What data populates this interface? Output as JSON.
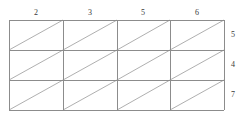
{
  "figure": {
    "type": "grid-diagram",
    "line_color": "#8c8c8c",
    "diagonal_color": "#a6a6a6",
    "label_color": "#3a3a3a",
    "background": "#ffffff",
    "grid": {
      "columns": 4,
      "rows": 3,
      "left": 9,
      "right": 224,
      "top": 20,
      "bottom": 110,
      "vertical_lines": [
        9,
        63,
        117,
        170,
        224
      ],
      "horizontal_lines": [
        20,
        50,
        80,
        110
      ],
      "diagonal_direction": "bottom-left-to-top-right"
    },
    "column_labels": [
      {
        "text": "2",
        "x": 36,
        "y": 13
      },
      {
        "text": "3",
        "x": 90,
        "y": 13
      },
      {
        "text": "5",
        "x": 143,
        "y": 13
      },
      {
        "text": "6",
        "x": 197,
        "y": 13
      }
    ],
    "row_labels": [
      {
        "text": "5",
        "x": 233,
        "y": 35
      },
      {
        "text": "4",
        "x": 233,
        "y": 65
      },
      {
        "text": "7",
        "x": 233,
        "y": 95
      }
    ]
  }
}
